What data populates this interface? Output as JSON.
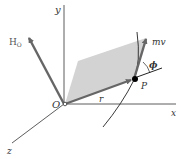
{
  "diagram": {
    "labels": {
      "y_axis": "y",
      "x_axis": "x",
      "z_axis": "z",
      "origin": "O",
      "angular_momentum": "H",
      "angular_momentum_sub": "O",
      "position_vector": "r",
      "linear_momentum": "mv",
      "particle": "P",
      "angle": "ϕ"
    },
    "colors": {
      "vector": "#666666",
      "plane": "#d3d3d3",
      "axis": "#333333",
      "particle": "#000000"
    }
  }
}
